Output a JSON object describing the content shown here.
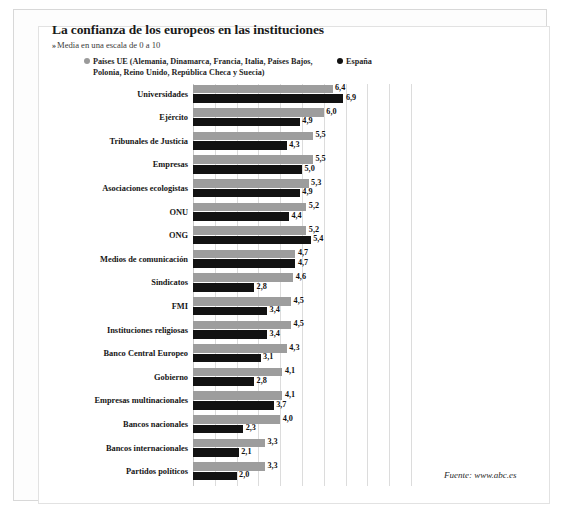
{
  "header": {
    "title": "La confianza de los europeos en las instituciones",
    "subtitle_marker": "»",
    "subtitle": "Media en una escala de 0 a 10"
  },
  "legend": {
    "eu_line1": "Países UE (Alemania, Dinamarca, Francia, Italia, Países Bajos,",
    "eu_line2": "Polonia, Reino Unido, República Checa y Suecia)",
    "es_label": "España",
    "eu_color": "#9d9d9d",
    "es_color": "#121212"
  },
  "source": {
    "text": "Fuente: www.abc.es"
  },
  "chart_data": {
    "type": "bar",
    "title": "La confianza de los europeos en las instituciones",
    "subtitle": "Media en una escala de 0 a 10",
    "orientation": "horizontal",
    "xlabel": "",
    "ylabel": "",
    "xlim": [
      0,
      10
    ],
    "grid": true,
    "gridline_step": 1,
    "legend_position": "top",
    "value_decimal_separator": ",",
    "categories": [
      "Universidades",
      "Ejército",
      "Tribunales de Justicia",
      "Empresas",
      "Asociaciones ecologistas",
      "ONU",
      "ONG",
      "Medios de comunicación",
      "Sindicatos",
      "FMI",
      "Instituciones religiosas",
      "Banco Central Europeo",
      "Gobierno",
      "Empresas multinacionales",
      "Bancos nacionales",
      "Bancos internacionales",
      "Partidos políticos"
    ],
    "series": [
      {
        "name": "Países UE",
        "color": "#9d9d9d",
        "values": [
          6.4,
          6.0,
          5.5,
          5.5,
          5.3,
          5.2,
          5.2,
          4.7,
          4.6,
          4.5,
          4.5,
          4.3,
          4.1,
          4.1,
          4.0,
          3.3,
          3.3
        ],
        "labels": [
          "6,4",
          "6,0",
          "5,5",
          "5,5",
          "5,3",
          "5,2",
          "5,2",
          "4,7",
          "4,6",
          "4,5",
          "4,5",
          "4,3",
          "4,1",
          "4,1",
          "4,0",
          "3,3",
          "3,3"
        ]
      },
      {
        "name": "España",
        "color": "#121212",
        "values": [
          6.9,
          4.9,
          4.3,
          5.0,
          4.9,
          4.4,
          5.4,
          4.7,
          2.8,
          3.4,
          3.4,
          3.1,
          2.8,
          3.7,
          2.3,
          2.1,
          2.0
        ],
        "labels": [
          "6,9",
          "4,9",
          "4,3",
          "5,0",
          "4,9",
          "4,4",
          "5,4",
          "4,7",
          "2,8",
          "3,4",
          "3,4",
          "3,1",
          "2,8",
          "3,7",
          "2,3",
          "2,1",
          "2,0"
        ]
      }
    ]
  }
}
